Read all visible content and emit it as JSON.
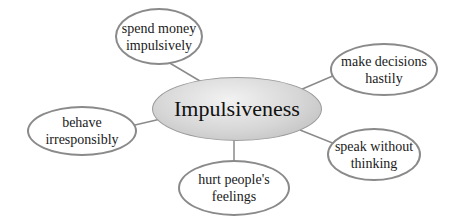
{
  "diagram": {
    "type": "mind-map",
    "center": {
      "label": "Impulsiveness"
    },
    "nodes": [
      {
        "id": "spend",
        "line1": "spend money",
        "line2": "impulsively"
      },
      {
        "id": "decisions",
        "line1": "make decisions",
        "line2": "hastily"
      },
      {
        "id": "behave",
        "line1": "behave",
        "line2": "irresponsibly"
      },
      {
        "id": "speak",
        "line1": "speak without",
        "line2": "thinking"
      },
      {
        "id": "hurt",
        "line1": "hurt people's",
        "line2": "feelings"
      }
    ],
    "colors": {
      "node_border": "#8a8a8a",
      "center_fill": "#d0d0d0",
      "connector": "#8a8a8a"
    }
  }
}
